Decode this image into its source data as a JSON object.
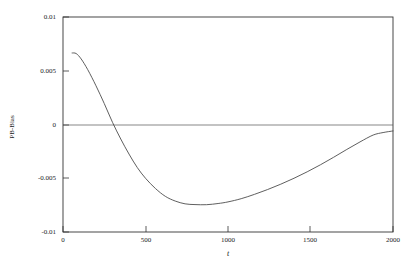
{
  "chart_data": {
    "type": "line",
    "title": "",
    "xlabel": "t",
    "ylabel": "PB-Bias",
    "xlim": [
      0,
      2000
    ],
    "ylim": [
      -0.01,
      0.01
    ],
    "xticks": [
      0,
      500,
      1000,
      1500,
      2000
    ],
    "xtick_labels": [
      "0",
      "500",
      "1000",
      "1500",
      "2000"
    ],
    "yticks": [
      0.01,
      0.005,
      0,
      -0.005,
      -0.01
    ],
    "ytick_labels": [
      "0.01",
      "0.005",
      "0",
      "-0.005",
      "-0.01"
    ],
    "grid": false,
    "legend": null,
    "zero_reference_line": true,
    "line_color": "#4d4d4d",
    "frame_color": "#333333",
    "background_color": "#ffffff",
    "series": [
      {
        "name": "PB-Bias",
        "x": [
          55,
          80,
          110,
          150,
          200,
          250,
          300,
          350,
          400,
          450,
          500,
          560,
          620,
          680,
          740,
          800,
          870,
          940,
          1000,
          1080,
          1160,
          1240,
          1320,
          1400,
          1480,
          1560,
          1640,
          1720,
          1800,
          1880,
          1940,
          2000
        ],
        "values": [
          0.00665,
          0.0066,
          0.0061,
          0.0051,
          0.0036,
          0.00195,
          0.0002,
          -0.00135,
          -0.00275,
          -0.004,
          -0.005,
          -0.00595,
          -0.00668,
          -0.00712,
          -0.00738,
          -0.00745,
          -0.00746,
          -0.00735,
          -0.0072,
          -0.0069,
          -0.0065,
          -0.00605,
          -0.00555,
          -0.005,
          -0.0044,
          -0.00375,
          -0.00305,
          -0.00232,
          -0.00162,
          -0.00098,
          -0.00075,
          -0.0006
        ]
      }
    ],
    "annotations": {
      "peak_value": 0.00665,
      "peak_t": 60,
      "zero_crossing_t": 300,
      "minimum_value": -0.00746,
      "minimum_t": 870,
      "end_value": -0.0006
    }
  },
  "axes": {
    "ytick_positions_px": [
      17,
      71,
      125,
      178,
      232
    ],
    "xtick_positions_px": [
      63,
      146,
      228,
      310,
      393
    ],
    "frame": {
      "left": 63,
      "top": 17,
      "right": 393,
      "bottom": 232
    }
  }
}
